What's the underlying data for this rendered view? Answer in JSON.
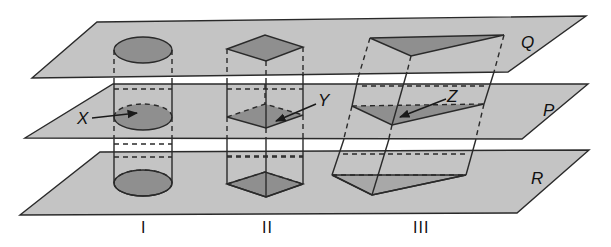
{
  "figure": {
    "colors": {
      "plane_fill": "#c4c4c4",
      "shape_fill": "#8f8f8f",
      "stroke": "#2a2a2a",
      "background": "#ffffff"
    },
    "planes": [
      {
        "name": "Q",
        "label": "Q"
      },
      {
        "name": "P",
        "label": "P"
      },
      {
        "name": "R",
        "label": "R"
      }
    ],
    "solids": [
      {
        "id": "I",
        "label": "I",
        "shape": "cylinder",
        "section_label": "X"
      },
      {
        "id": "II",
        "label": "II",
        "shape": "square-prism",
        "section_label": "Y"
      },
      {
        "id": "III",
        "label": "III",
        "shape": "oblique-triangular-prism",
        "section_label": "Z"
      }
    ]
  }
}
